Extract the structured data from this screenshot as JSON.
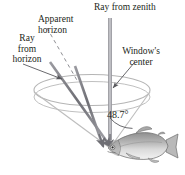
{
  "figure": {
    "labels": {
      "ray_from_zenith": "Ray from zenith",
      "apparent_horizon": "Apparent\nhorizon",
      "ray_from_horizon": "Ray\nfrom\nhorizon",
      "windows_center": "Window's\ncenter",
      "angle": "48.7°"
    },
    "icons": {
      "fish": "fish-icon",
      "cone": "cone-icon",
      "arrow_zenith": "arrow-down-icon",
      "arrow_window": "arrow-pointer-icon",
      "arrow_horizon": "arrow-pointer-icon"
    },
    "colors": {
      "text": "#231f20",
      "ray": "#7b7b80",
      "cone": "#b3b3b3",
      "dashed": "#8a8a8f",
      "fish_body": "#cfcfcf",
      "fish_dark": "#7a7a7a",
      "background": "#ffffff"
    },
    "geometry": {
      "apex_x": 110,
      "apex_y": 148,
      "angle_degrees": 48.7,
      "cone_rim_cx": 92,
      "cone_rim_cy": 90,
      "cone_rim_rx": 58,
      "cone_rim_ry": 15
    }
  }
}
